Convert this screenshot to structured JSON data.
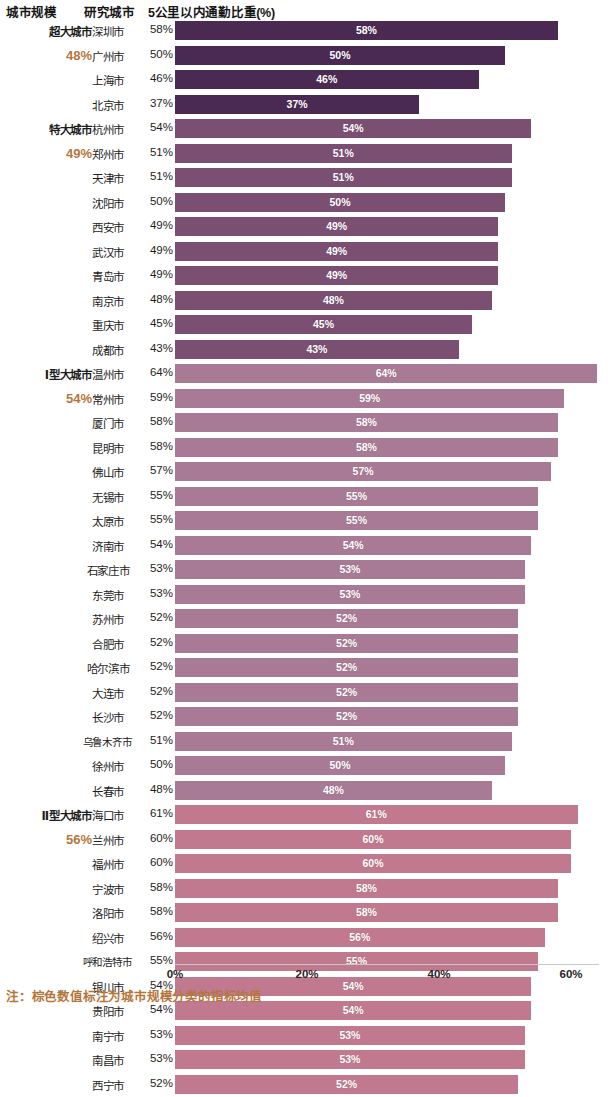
{
  "header": {
    "col_scale": "城市规模",
    "col_city": "研究城市",
    "col_metric": "5公里以内通勤比重(%)"
  },
  "footnote": "注：棕色数值标注为城市规模分类的指标均值",
  "axis": {
    "ticks": [
      "0%",
      "20%",
      "40%",
      "60%"
    ],
    "tick_values": [
      0,
      20,
      40,
      60
    ],
    "min": 0,
    "max": 64
  },
  "colors": {
    "group_0_bar": "#4a2a52",
    "group_1_bar": "#7a4f72",
    "group_2_bar": "#a87a95",
    "group_3_bar": "#c0798f",
    "group_avg_text": "#b5763c",
    "axis_text": "#262626",
    "bar_label_text": "#ffffff"
  },
  "chart_data": {
    "type": "bar",
    "title": "5公里以内通勤比重(%)",
    "xlabel": "",
    "ylabel": "",
    "xlim": [
      0,
      64
    ],
    "grid": false,
    "legend": "none",
    "orientation": "horizontal",
    "groups": [
      {
        "name": "超大城市",
        "average": "48%",
        "color": "#4a2a52",
        "cities": [
          {
            "name": "深圳市",
            "value": 58,
            "label": "58%"
          },
          {
            "name": "广州市",
            "value": 50,
            "label": "50%"
          },
          {
            "name": "上海市",
            "value": 46,
            "label": "46%"
          },
          {
            "name": "北京市",
            "value": 37,
            "label": "37%"
          }
        ]
      },
      {
        "name": "特大城市",
        "average": "49%",
        "color": "#7a4f72",
        "cities": [
          {
            "name": "杭州市",
            "value": 54,
            "label": "54%"
          },
          {
            "name": "郑州市",
            "value": 51,
            "label": "51%"
          },
          {
            "name": "天津市",
            "value": 51,
            "label": "51%"
          },
          {
            "name": "沈阳市",
            "value": 50,
            "label": "50%"
          },
          {
            "name": "西安市",
            "value": 49,
            "label": "49%"
          },
          {
            "name": "武汉市",
            "value": 49,
            "label": "49%"
          },
          {
            "name": "青岛市",
            "value": 49,
            "label": "49%"
          },
          {
            "name": "南京市",
            "value": 48,
            "label": "48%"
          },
          {
            "name": "重庆市",
            "value": 45,
            "label": "45%"
          },
          {
            "name": "成都市",
            "value": 43,
            "label": "43%"
          }
        ]
      },
      {
        "name": "Ⅰ型大城市",
        "average": "54%",
        "color": "#a87a95",
        "cities": [
          {
            "name": "温州市",
            "value": 64,
            "label": "64%"
          },
          {
            "name": "常州市",
            "value": 59,
            "label": "59%"
          },
          {
            "name": "厦门市",
            "value": 58,
            "label": "58%"
          },
          {
            "name": "昆明市",
            "value": 58,
            "label": "58%"
          },
          {
            "name": "佛山市",
            "value": 57,
            "label": "57%"
          },
          {
            "name": "无锡市",
            "value": 55,
            "label": "55%"
          },
          {
            "name": "太原市",
            "value": 55,
            "label": "55%"
          },
          {
            "name": "济南市",
            "value": 54,
            "label": "54%"
          },
          {
            "name": "石家庄市",
            "value": 53,
            "label": "53%"
          },
          {
            "name": "东莞市",
            "value": 53,
            "label": "53%"
          },
          {
            "name": "苏州市",
            "value": 52,
            "label": "52%"
          },
          {
            "name": "合肥市",
            "value": 52,
            "label": "52%"
          },
          {
            "name": "哈尔滨市",
            "value": 52,
            "label": "52%"
          },
          {
            "name": "大连市",
            "value": 52,
            "label": "52%"
          },
          {
            "name": "长沙市",
            "value": 52,
            "label": "52%"
          },
          {
            "name": "乌鲁木齐市",
            "value": 51,
            "label": "51%"
          },
          {
            "name": "徐州市",
            "value": 50,
            "label": "50%"
          },
          {
            "name": "长春市",
            "value": 48,
            "label": "48%"
          }
        ]
      },
      {
        "name": "Ⅱ型大城市",
        "average": "56%",
        "color": "#c0798f",
        "cities": [
          {
            "name": "海口市",
            "value": 61,
            "label": "61%"
          },
          {
            "name": "兰州市",
            "value": 60,
            "label": "60%"
          },
          {
            "name": "福州市",
            "value": 60,
            "label": "60%"
          },
          {
            "name": "宁波市",
            "value": 58,
            "label": "58%"
          },
          {
            "name": "洛阳市",
            "value": 58,
            "label": "58%"
          },
          {
            "name": "绍兴市",
            "value": 56,
            "label": "56%"
          },
          {
            "name": "呼和浩特市",
            "value": 55,
            "label": "55%"
          },
          {
            "name": "银川市",
            "value": 54,
            "label": "54%"
          },
          {
            "name": "贵阳市",
            "value": 54,
            "label": "54%"
          },
          {
            "name": "南宁市",
            "value": 53,
            "label": "53%"
          },
          {
            "name": "南昌市",
            "value": 53,
            "label": "53%"
          },
          {
            "name": "西宁市",
            "value": 52,
            "label": "52%"
          }
        ]
      }
    ]
  }
}
